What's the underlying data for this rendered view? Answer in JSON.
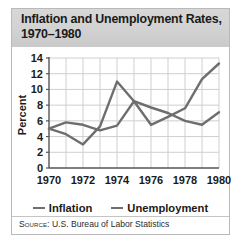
{
  "figure": {
    "title": "Inflation and Unemployment Rates,\n1970–1980",
    "source_keyword": "Source:",
    "source_text": "U.S. Bureau of Labor Statistics",
    "colors": {
      "series_line": "#6e6e6e",
      "axis": "#555555",
      "grid": "#cfcfcf",
      "title_band": "#d2d2d2",
      "border": "#b9b9b9",
      "text": "#1a1a1a"
    }
  },
  "chart_data": {
    "type": "line",
    "title": "Inflation and Unemployment Rates, 1970–1980",
    "xlabel": "",
    "ylabel": "Percent",
    "x": [
      1970,
      1971,
      1972,
      1973,
      1974,
      1975,
      1976,
      1977,
      1978,
      1979,
      1980
    ],
    "xlim": [
      1970,
      1980
    ],
    "ylim": [
      0,
      14
    ],
    "ytick_step": 2,
    "yticks": [
      0,
      2,
      4,
      6,
      8,
      10,
      12,
      14
    ],
    "xticks": [
      1970,
      1972,
      1974,
      1976,
      1978,
      1980
    ],
    "xtick_labels": [
      "1970",
      "1972",
      "1974",
      "1976",
      "1978",
      "1980"
    ],
    "ytick_labels": [
      "0",
      "2",
      "4",
      "6",
      "8",
      "10",
      "12",
      "14"
    ],
    "grid": true,
    "legend_position": "bottom",
    "series": [
      {
        "name": "Inflation",
        "values": [
          5.0,
          4.3,
          3.0,
          5.3,
          11.0,
          8.5,
          5.5,
          6.5,
          7.6,
          11.3,
          13.3
        ]
      },
      {
        "name": "Unemployment",
        "values": [
          5.0,
          5.8,
          5.5,
          4.8,
          5.4,
          8.5,
          7.7,
          7.0,
          6.0,
          5.5,
          7.1
        ]
      }
    ]
  }
}
